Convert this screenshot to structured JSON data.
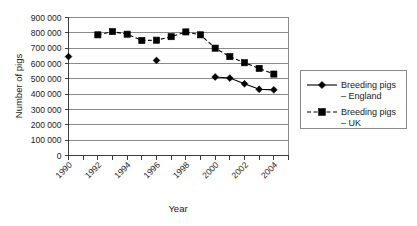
{
  "chart_data": {
    "type": "line",
    "title": "",
    "xlabel": "Year",
    "ylabel": "Number of pigs",
    "xlim": [
      1990,
      2005
    ],
    "ylim": [
      0,
      900000
    ],
    "ytick_step": 100000,
    "xtick_step": 2,
    "grid": true,
    "legend_position": "right",
    "xticks": [
      "1990",
      "1992",
      "1994",
      "1996",
      "1998",
      "2000",
      "2002",
      "2004"
    ],
    "yticks": [
      "0",
      "100000",
      "200000",
      "300000",
      "400000",
      "500000",
      "600000",
      "700000",
      "800000",
      "900000"
    ],
    "x": [
      1990,
      1991,
      1992,
      1993,
      1994,
      1995,
      1996,
      1997,
      1998,
      1999,
      2000,
      2001,
      2002,
      2003,
      2004
    ],
    "series": [
      {
        "name": "Breeding pigs – England",
        "marker": "diamond",
        "linestyle": "solid",
        "color": "#000000",
        "values": [
          645000,
          null,
          null,
          null,
          null,
          null,
          620000,
          null,
          null,
          null,
          512000,
          505000,
          468000,
          432000,
          428000
        ]
      },
      {
        "name": "Breeding pigs – UK",
        "marker": "square",
        "linestyle": "dashed",
        "color": "#000000",
        "values": [
          null,
          null,
          787000,
          808000,
          791000,
          750000,
          752000,
          775000,
          806000,
          787000,
          700000,
          645000,
          605000,
          568000,
          531000
        ]
      }
    ]
  },
  "legend": {
    "entries": [
      {
        "line1": "Breeding pigs",
        "line2": "– England"
      },
      {
        "line1": "Breeding pigs",
        "line2": "– UK"
      }
    ]
  }
}
